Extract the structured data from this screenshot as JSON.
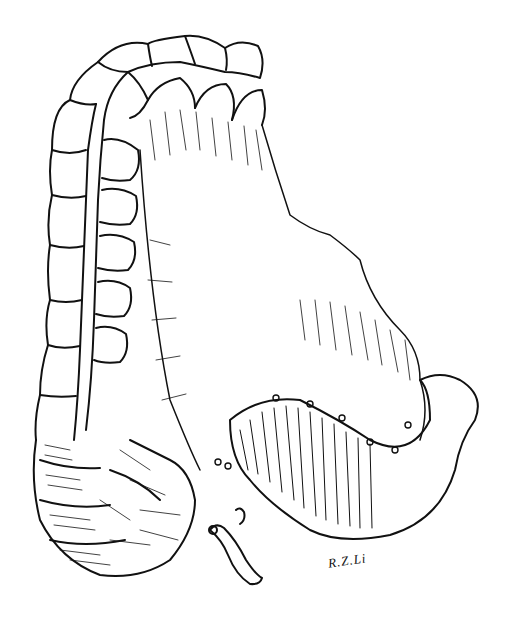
{
  "figure": {
    "signature": "R.Z.Li",
    "colors": {
      "ink": "#111111",
      "paper": "#ffffff"
    }
  }
}
